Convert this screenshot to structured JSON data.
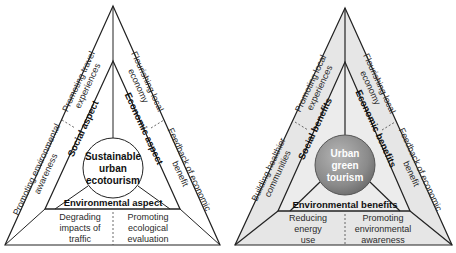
{
  "diagrams": [
    {
      "id": "left",
      "center": [
        "Sustainable",
        "urban",
        "ecotourism"
      ],
      "aspects": {
        "social": "Social aspect",
        "economic": "Economic aspect",
        "environmental": "Environmental aspect"
      },
      "outer": {
        "top_left": [
          "Promoting travel",
          "experiences"
        ],
        "top_right": [
          "Flourishing local",
          "economy"
        ],
        "left": [
          "Promoting environmental",
          "awareness"
        ],
        "right": [
          "Feedback of economic",
          "benefit"
        ],
        "bottom_left": [
          "Degrading",
          "impacts of",
          "traffic"
        ],
        "bottom_right": [
          "Promoting",
          "ecological",
          "evaluation"
        ]
      },
      "colors": {
        "fill": "#ffffff",
        "circle": "#ffffff",
        "stroke": "#222222"
      }
    },
    {
      "id": "right",
      "center": [
        "Urban",
        "green",
        "tourism"
      ],
      "aspects": {
        "social": "Social benefits",
        "economic": "Economic benefits",
        "environmental": "Environmental benefits"
      },
      "outer": {
        "top_left": [
          "Promoting local",
          "experiences"
        ],
        "top_right": [
          "Flourishing local",
          "economy"
        ],
        "left": [
          "Building healthier",
          "communities"
        ],
        "right": [
          "Feedback of economic",
          "benefit"
        ],
        "bottom_left": [
          "Reducing",
          "energy",
          "use"
        ],
        "bottom_right": [
          "Promoting",
          "environmental",
          "awareness"
        ]
      },
      "colors": {
        "fill": "#e6e6e6",
        "circle": "#8c8c8c",
        "stroke": "#222222"
      }
    }
  ]
}
